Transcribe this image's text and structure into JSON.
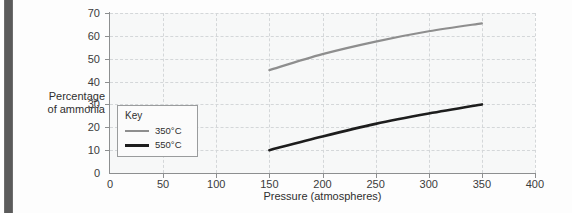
{
  "chart_data": {
    "type": "line",
    "title": "",
    "xlabel": "Pressure (atmospheres)",
    "ylabel": "Percentage of ammonia",
    "ylabel_line1": "Percentage",
    "ylabel_line2": "of ammonia",
    "xlim": [
      0,
      400
    ],
    "ylim": [
      0,
      70
    ],
    "xticks": [
      "0",
      "50",
      "100",
      "150",
      "200",
      "250",
      "300",
      "350",
      "400"
    ],
    "yticks": [
      "0",
      "10",
      "20",
      "30",
      "40",
      "50",
      "60",
      "70"
    ],
    "grid": "dashed-both",
    "legend_position": "inside-left",
    "legend_title": "Key",
    "series": [
      {
        "name": "350°C",
        "color": "#8e8e8e",
        "x": [
          150,
          200,
          250,
          300,
          350
        ],
        "values": [
          45,
          52,
          57.5,
          62,
          65.5
        ]
      },
      {
        "name": "550°C",
        "color": "#1d1d1d",
        "x": [
          150,
          200,
          250,
          300,
          350
        ],
        "values": [
          10,
          16,
          21.5,
          26,
          30
        ]
      }
    ]
  },
  "legend": {
    "title": "Key",
    "items": [
      {
        "label": "350°C",
        "color": "#8e8e8e"
      },
      {
        "label": "550°C",
        "color": "#1d1d1d"
      }
    ]
  },
  "axes": {
    "x_title": "Pressure (atmospheres)",
    "y_title_line1": "Percentage",
    "y_title_line2": "of ammonia",
    "x_ticks": [
      "0",
      "50",
      "100",
      "150",
      "200",
      "250",
      "300",
      "350",
      "400"
    ],
    "y_ticks": [
      "70",
      "60",
      "50",
      "40",
      "30",
      "20",
      "10",
      "0"
    ]
  },
  "colors": {
    "series_350": "#8e8e8e",
    "series_550": "#1d1d1d",
    "axis": "#8d8f90",
    "grid": "#d4d7d9",
    "plot_bg": "#f7f8f8",
    "spine": "#5b5b5b"
  }
}
